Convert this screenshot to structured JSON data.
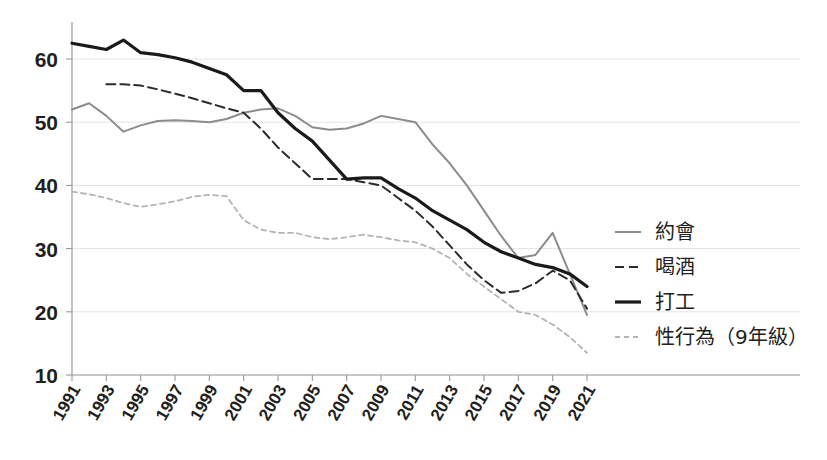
{
  "chart_data": {
    "type": "line",
    "title": "",
    "xlabel": "",
    "ylabel": "",
    "xlim": [
      1991,
      2021
    ],
    "ylim": [
      10,
      65
    ],
    "yticks": [
      10,
      20,
      30,
      40,
      50,
      60
    ],
    "grid": true,
    "legend_position": "right",
    "x": [
      1991,
      1992,
      1993,
      1994,
      1995,
      1996,
      1997,
      1998,
      1999,
      2000,
      2001,
      2002,
      2003,
      2004,
      2005,
      2006,
      2007,
      2008,
      2009,
      2010,
      2011,
      2012,
      2013,
      2014,
      2015,
      2016,
      2017,
      2018,
      2019,
      2020,
      2021
    ],
    "xtick_labels": [
      "1991",
      "1993",
      "1995",
      "1997",
      "1999",
      "2001",
      "2003",
      "2005",
      "2007",
      "2009",
      "2011",
      "2013",
      "2015",
      "2017",
      "2019",
      "2021"
    ],
    "series": [
      {
        "name": "約會",
        "style": "solid",
        "color": "#8c8c8c",
        "width": 2.0,
        "values": [
          52.0,
          53.0,
          51.0,
          48.5,
          49.5,
          50.2,
          50.3,
          50.2,
          50.0,
          50.5,
          51.5,
          52.0,
          52.2,
          51.0,
          49.2,
          48.8,
          49.0,
          49.8,
          51.0,
          50.5,
          50.0,
          46.5,
          43.5,
          40.0,
          36.0,
          32.0,
          28.5,
          29.0,
          32.5,
          26.0,
          19.5
        ]
      },
      {
        "name": "喝酒",
        "style": "dashed",
        "color": "#2b2b2b",
        "width": 2.0,
        "values": [
          null,
          null,
          56.0,
          56.0,
          55.8,
          55.2,
          54.5,
          53.8,
          53.0,
          52.2,
          51.5,
          49.0,
          46.0,
          43.5,
          41.0,
          41.0,
          41.0,
          40.5,
          40.0,
          38.0,
          36.0,
          33.5,
          30.5,
          27.5,
          25.0,
          23.0,
          23.3,
          24.5,
          26.5,
          25.0,
          20.5
        ]
      },
      {
        "name": "打工",
        "style": "solid-bold",
        "color": "#1a1a1a",
        "width": 3.2,
        "values": [
          62.5,
          62.0,
          61.5,
          63.0,
          61.0,
          60.7,
          60.2,
          59.5,
          58.5,
          57.5,
          55.0,
          55.0,
          51.5,
          49.0,
          47.0,
          44.0,
          41.0,
          41.2,
          41.2,
          39.5,
          38.0,
          36.0,
          34.5,
          33.0,
          31.0,
          29.5,
          28.5,
          27.5,
          27.0,
          26.0,
          24.0
        ]
      },
      {
        "name": "性行為（9年級）",
        "style": "dotted",
        "color": "#b4b4b4",
        "width": 1.8,
        "values": [
          39.0,
          38.6,
          38.0,
          37.2,
          36.6,
          37.0,
          37.5,
          38.2,
          38.5,
          38.3,
          34.5,
          33.0,
          32.5,
          32.5,
          31.8,
          31.5,
          31.8,
          32.2,
          31.8,
          31.3,
          31.0,
          30.0,
          28.5,
          26.0,
          24.0,
          22.0,
          20.0,
          19.5,
          18.0,
          16.0,
          13.5
        ]
      }
    ]
  },
  "legend": {
    "items": [
      {
        "label": "約會"
      },
      {
        "label": "喝酒"
      },
      {
        "label": "打工"
      },
      {
        "label": "性行為（9年級）"
      }
    ]
  }
}
